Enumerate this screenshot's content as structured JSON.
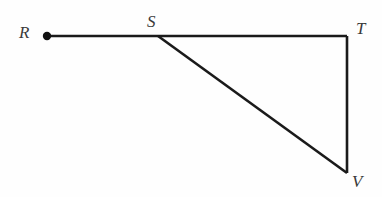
{
  "figure": {
    "type": "geometry-diagram",
    "canvas": {
      "width": 382,
      "height": 197,
      "background": "#fefefe"
    },
    "style": {
      "line_color": "#1a1a1a",
      "line_width": 2.6,
      "label_color": "#3a3a3a",
      "label_font_style": "italic",
      "label_font_size": 17
    },
    "points": [
      {
        "id": "R",
        "label": "R",
        "x": 47,
        "y": 36,
        "marker": "filled-dot",
        "marker_radius": 4.2
      },
      {
        "id": "S",
        "label": "S",
        "x": 158,
        "y": 36,
        "marker": "none"
      },
      {
        "id": "T",
        "label": "T",
        "x": 347,
        "y": 36,
        "marker": "none"
      },
      {
        "id": "V",
        "label": "V",
        "x": 347,
        "y": 173,
        "marker": "none"
      }
    ],
    "segments": [
      {
        "id": "RT",
        "from": "R",
        "to": "T",
        "orientation": "horizontal"
      },
      {
        "id": "SV",
        "from": "S",
        "to": "V",
        "orientation": "diagonal"
      },
      {
        "id": "TV",
        "from": "T",
        "to": "V",
        "orientation": "vertical"
      }
    ],
    "labels": {
      "R": "R",
      "S": "S",
      "T": "T",
      "V": "V"
    }
  }
}
